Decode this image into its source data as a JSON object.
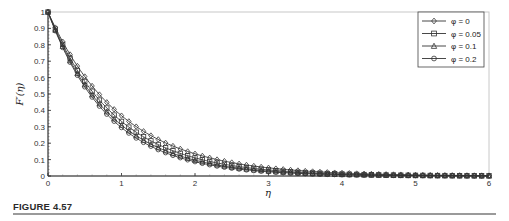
{
  "figure": {
    "caption": "FIGURE 4.57"
  },
  "chart_data": {
    "type": "line",
    "title": "",
    "xlabel": "η",
    "ylabel": "F′(η)",
    "xlim": [
      0,
      6
    ],
    "ylim": [
      0,
      1
    ],
    "xticks": [
      0,
      1,
      2,
      3,
      4,
      5,
      6
    ],
    "yticks": [
      0,
      0.1,
      0.2,
      0.3,
      0.4,
      0.5,
      0.6,
      0.7,
      0.8,
      0.9,
      1
    ],
    "ytick_labels": [
      "0",
      "0.1",
      "0.2",
      "0.3",
      "0.4",
      "0.5",
      "0.6",
      "0.7",
      "0.8",
      "0.9",
      "1"
    ],
    "grid": false,
    "legend_position": "upper right",
    "x": [
      0,
      0.5,
      1,
      1.5,
      2,
      2.5,
      3,
      3.5,
      4,
      4.5,
      5,
      5.5,
      6
    ],
    "series": [
      {
        "name": "φ = 0",
        "marker": "diamond",
        "decay": 1.0,
        "values": [
          1.0,
          0.6,
          0.36,
          0.22,
          0.13,
          0.08,
          0.05,
          0.03,
          0.018,
          0.011,
          0.007,
          0.004,
          0.002
        ]
      },
      {
        "name": "φ = 0.05",
        "marker": "square",
        "decay": 1.1,
        "values": [
          1.0,
          0.57,
          0.33,
          0.19,
          0.11,
          0.065,
          0.037,
          0.021,
          0.012,
          0.007,
          0.004,
          0.002,
          0.001
        ]
      },
      {
        "name": "φ = 0.1",
        "marker": "triangle",
        "decay": 1.17,
        "values": [
          1.0,
          0.56,
          0.31,
          0.17,
          0.096,
          0.054,
          0.03,
          0.017,
          0.009,
          0.005,
          0.003,
          0.002,
          0.001
        ]
      },
      {
        "name": "φ = 0.2",
        "marker": "circle",
        "decay": 1.22,
        "values": [
          1.0,
          0.54,
          0.29,
          0.16,
          0.087,
          0.047,
          0.026,
          0.014,
          0.008,
          0.004,
          0.002,
          0.001,
          0.001
        ]
      }
    ],
    "marker_spacing": 0.1,
    "line_color": "#333333"
  },
  "legend": {
    "items": [
      {
        "label": "φ = 0",
        "marker": "diamond"
      },
      {
        "label": "φ = 0.05",
        "marker": "square"
      },
      {
        "label": "φ = 0.1",
        "marker": "triangle"
      },
      {
        "label": "φ = 0.2",
        "marker": "circle"
      }
    ]
  }
}
